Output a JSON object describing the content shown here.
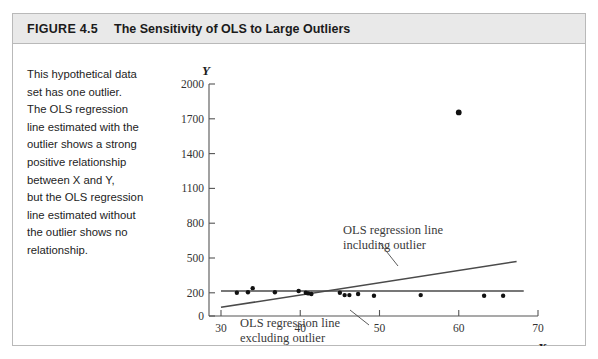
{
  "figure": {
    "label": "FIGURE 4.5",
    "title": "The Sensitivity of OLS to Large Outliers",
    "caption_lines": [
      "This hypothetical data",
      "set has one outlier.",
      "The OLS regression",
      "line estimated with the",
      "outlier shows a strong",
      "positive relationship",
      "between X and Y,",
      "but the OLS regression",
      "line estimated without",
      "the outlier shows no",
      "relationship."
    ],
    "caption_text": "This hypothetical data set has one outlier. The OLS regression line estimated with the outlier shows a strong positive relationship between X and Y, but the OLS regression line estimated without the outlier shows no relationship.",
    "header_bg": "#e9e9e9",
    "border_color": "#b9b9b9"
  },
  "chart_data": {
    "type": "scatter",
    "title": "The Sensitivity of OLS to Large Outliers",
    "xlabel": "X",
    "ylabel": "Y",
    "xlim": [
      30,
      70
    ],
    "ylim": [
      0,
      2000
    ],
    "xticks": [
      30,
      40,
      50,
      60,
      70
    ],
    "yticks": [
      0,
      200,
      500,
      800,
      1100,
      1400,
      1700,
      2000
    ],
    "grid": false,
    "legend_position": "inline-annotations",
    "points": [
      {
        "x": 32.0,
        "y": 200
      },
      {
        "x": 33.4,
        "y": 205
      },
      {
        "x": 34.0,
        "y": 240
      },
      {
        "x": 36.8,
        "y": 205
      },
      {
        "x": 39.8,
        "y": 215
      },
      {
        "x": 40.7,
        "y": 200
      },
      {
        "x": 41.0,
        "y": 195
      },
      {
        "x": 41.4,
        "y": 190
      },
      {
        "x": 45.0,
        "y": 200
      },
      {
        "x": 45.6,
        "y": 180
      },
      {
        "x": 46.2,
        "y": 180
      },
      {
        "x": 47.3,
        "y": 190
      },
      {
        "x": 49.3,
        "y": 175
      },
      {
        "x": 55.2,
        "y": 180
      },
      {
        "x": 60.0,
        "y": 1755
      },
      {
        "x": 63.2,
        "y": 175
      },
      {
        "x": 65.6,
        "y": 175
      }
    ],
    "outlier": {
      "x": 60.0,
      "y": 1755,
      "label": "outlier"
    },
    "lines": [
      {
        "name": "OLS regression line including outlier",
        "annotation_lines": [
          "OLS regression line",
          "including outlier"
        ],
        "x_start": 30.0,
        "y_start": 75,
        "x_end": 67.3,
        "y_end": 470,
        "style": "solid"
      },
      {
        "name": "OLS regression line excluding outlier",
        "annotation_lines": [
          "OLS regression line",
          "excluding outlier"
        ],
        "x_start": 30.0,
        "y_start": 215,
        "x_end": 68.2,
        "y_end": 215,
        "style": "solid"
      }
    ],
    "annotations": [
      {
        "id": "annot-including",
        "lines": [
          "OLS regression line",
          "including outlier"
        ],
        "text": "OLS regression line including outlier"
      },
      {
        "id": "annot-excluding",
        "lines": [
          "OLS regression line",
          "excluding outlier"
        ],
        "text": "OLS regression line excluding outlier"
      }
    ]
  },
  "axis": {
    "y_title": "Y",
    "x_title": "X",
    "y_tick_labels": [
      "2000",
      "1700",
      "1400",
      "1100",
      "800",
      "500",
      "200",
      "0"
    ],
    "x_tick_labels": [
      "30",
      "40",
      "50",
      "60",
      "70"
    ]
  }
}
